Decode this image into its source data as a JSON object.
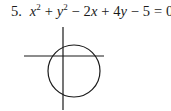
{
  "problem": {
    "number": "5.",
    "equation_parts": {
      "x": "x",
      "exp1": "2",
      "plus1": " + ",
      "y": "y",
      "exp2": "2",
      "minus1": " − 2",
      "x2": "x",
      "plus2": " + 4",
      "y2": "y",
      "rest": " − 5 = 0"
    },
    "equation_text": "x² + y² − 2x + 4y − 5 = 0"
  },
  "graph": {
    "circle": {
      "cx": 74,
      "cy": 71,
      "r": 26
    },
    "x_axis": {
      "x1": 24,
      "x2": 104,
      "y": 56
    },
    "y_axis": {
      "x": 63,
      "y1": 27,
      "y2": 110
    },
    "stroke_color": "#1a1a1a"
  }
}
